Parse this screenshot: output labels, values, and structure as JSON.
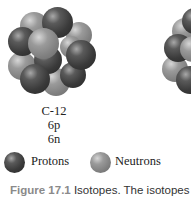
{
  "nucleus_left": {
    "isotope": "C-12",
    "protons": "6p",
    "neutrons": "6n"
  },
  "legend": {
    "protons_label": "Protons",
    "neutrons_label": "Neutrons"
  },
  "caption": {
    "figure_number": "Figure 17.1",
    "text": "Isotopes. The isotopes"
  },
  "colors": {
    "proton": "#3a3a3a",
    "neutron": "#8a8a8a",
    "caption_number": "#8a8a8a"
  }
}
